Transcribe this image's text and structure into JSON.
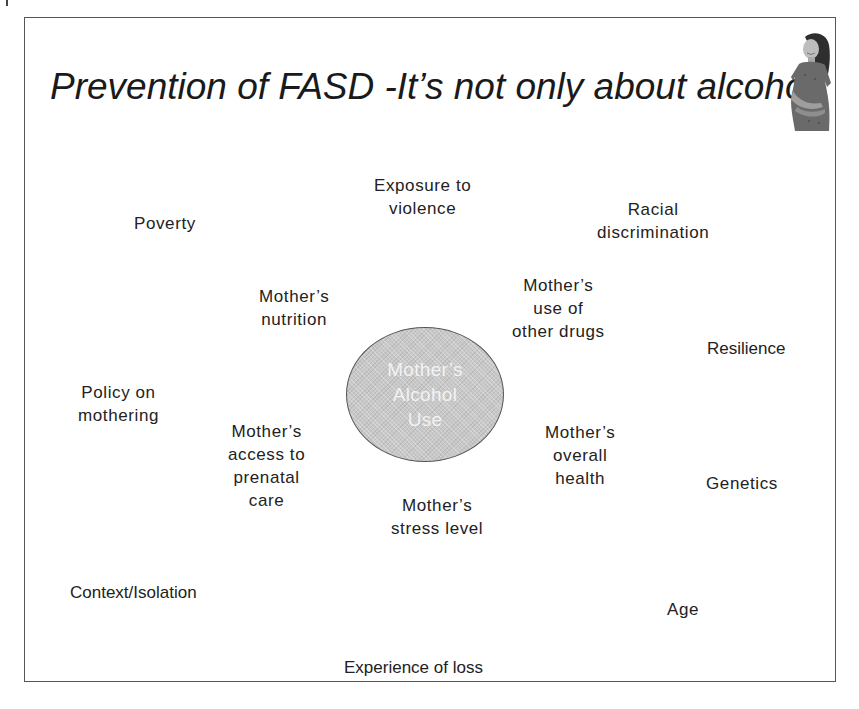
{
  "slide": {
    "title": "Prevention of FASD -It’s not only about alcohol",
    "image": "pregnant-woman-photo",
    "center": {
      "lines": [
        "Mother’s",
        "Alcohol",
        "Use"
      ],
      "fill_color": "#c8c8c8",
      "text_color": "#f2f2f2"
    },
    "factors": {
      "exposure_violence": [
        "Exposure to",
        "violence"
      ],
      "poverty": [
        "Poverty"
      ],
      "racial_discrimination": [
        "Racial",
        "discrimination"
      ],
      "mothers_nutrition": [
        "Mother’s",
        "nutrition"
      ],
      "mothers_other_drugs": [
        "Mother’s",
        "use of",
        "other drugs"
      ],
      "resilience": [
        "Resilience"
      ],
      "policy_mothering": [
        "Policy on",
        "mothering"
      ],
      "mothers_prenatal_care": [
        "Mother’s",
        "access to",
        "prenatal",
        "care"
      ],
      "mothers_overall_health": [
        "Mother’s",
        "overall",
        "health"
      ],
      "genetics": [
        "Genetics"
      ],
      "mothers_stress": [
        "Mother’s",
        "stress level"
      ],
      "context_isolation": [
        "Context/Isolation"
      ],
      "age": [
        "Age"
      ],
      "experience_loss": [
        "Experience of loss"
      ]
    }
  }
}
